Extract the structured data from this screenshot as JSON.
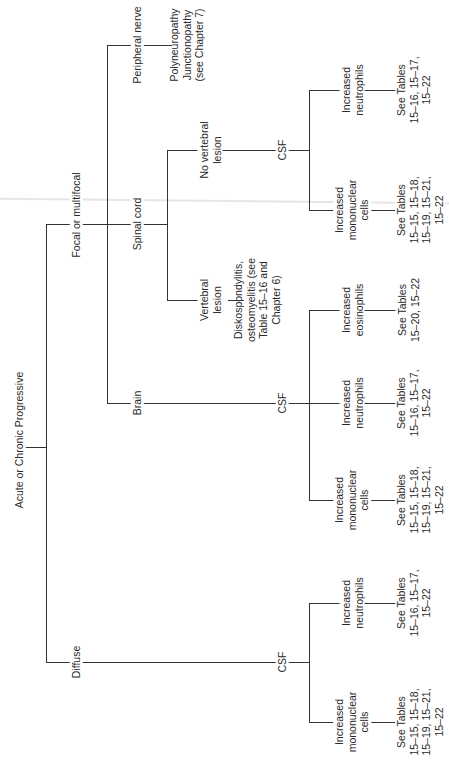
{
  "diagram": {
    "root": "Acute or Chronic Progressive",
    "level1": {
      "focal": "Focal or multifocal",
      "diffuse": "Diffuse"
    },
    "focal_children": {
      "peripheral": "Peripheral nerve",
      "spinal": "Spinal cord",
      "brain": "Brain"
    },
    "peripheral_result": [
      "Polyneuropathy",
      "Junctionopathy",
      "(see Chapter 7)"
    ],
    "spinal_children": {
      "no_vertebral": [
        "No vertebral",
        "lesion"
      ],
      "vertebral": [
        "Vertebral",
        "lesion"
      ]
    },
    "vertebral_result": [
      "Diskospondylitis,",
      "osteomyelitis (see",
      "Table 15–16 and",
      "Chapter 6)"
    ],
    "csf_label": "CSF",
    "spinal_csf": {
      "neutrophils": {
        "label": [
          "Increased",
          "neutrophils"
        ],
        "tables": [
          "See Tables",
          "15–16, 15–17,",
          "15–22"
        ]
      },
      "mononuclear": {
        "label": [
          "Increased",
          "mononuclear",
          "cells"
        ],
        "tables": [
          "See Tables",
          "15–15, 15–18,",
          "15–19, 15–21,",
          "15–22"
        ]
      }
    },
    "brain_csf": {
      "eosinophils": {
        "label": [
          "Increased",
          "eosinophils"
        ],
        "tables": [
          "See Tables",
          "15–20, 15–22"
        ]
      },
      "neutrophils": {
        "label": [
          "Increased",
          "neutrophils"
        ],
        "tables": [
          "See Tables",
          "15–16, 15–17,",
          "15–22"
        ]
      },
      "mononuclear": {
        "label": [
          "Increased",
          "mononuclear",
          "cells"
        ],
        "tables": [
          "See Tables",
          "15–15, 15–18,",
          "15–19, 15–21,",
          "15–22"
        ]
      }
    },
    "diffuse_csf": {
      "neutrophils": {
        "label": [
          "Increased",
          "neutrophils"
        ],
        "tables": [
          "See Tables",
          "15–16, 15–17,",
          "15–22"
        ]
      },
      "mononuclear": {
        "label": [
          "Increased",
          "mononuclear",
          "cells"
        ],
        "tables": [
          "See Tables",
          "15–15, 15–18,",
          "15–19, 15–21,",
          "15–22"
        ]
      }
    },
    "line_color": "#333333"
  }
}
